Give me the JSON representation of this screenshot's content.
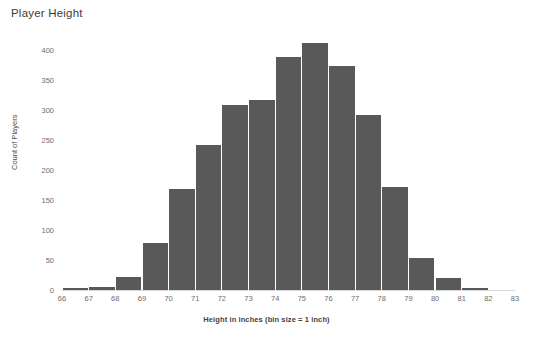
{
  "chart_data": {
    "type": "bar",
    "title": "Player Height",
    "xlabel": "Height in inches (bin size = 1 inch)",
    "ylabel": "Count of Players",
    "grid": false,
    "legend": "none",
    "bar_color": "#595959",
    "axis_color": "#d9d9d9",
    "tick_text_color": "#6e6e6e",
    "xlim": [
      66,
      83
    ],
    "ylim": [
      0,
      400
    ],
    "x_ticks": [
      "66",
      "67",
      "68",
      "69",
      "70",
      "71",
      "72",
      "73",
      "74",
      "75",
      "76",
      "77",
      "78",
      "79",
      "80",
      "81",
      "82",
      "83"
    ],
    "y_ticks": [
      "0",
      "50",
      "100",
      "150",
      "200",
      "250",
      "300",
      "350",
      "400"
    ],
    "bin_size": 1,
    "bins": [
      {
        "left": 66,
        "right": 67,
        "label": "66",
        "value": 3
      },
      {
        "left": 67,
        "right": 68,
        "label": "67",
        "value": 5
      },
      {
        "left": 68,
        "right": 69,
        "label": "68",
        "value": 22
      },
      {
        "left": 69,
        "right": 70,
        "label": "69",
        "value": 78
      },
      {
        "left": 70,
        "right": 71,
        "label": "70",
        "value": 168
      },
      {
        "left": 71,
        "right": 72,
        "label": "71",
        "value": 241
      },
      {
        "left": 72,
        "right": 73,
        "label": "72",
        "value": 309
      },
      {
        "left": 73,
        "right": 74,
        "label": "73",
        "value": 317
      },
      {
        "left": 74,
        "right": 75,
        "label": "74",
        "value": 388
      },
      {
        "left": 75,
        "right": 76,
        "label": "75",
        "value": 412
      },
      {
        "left": 76,
        "right": 77,
        "label": "76",
        "value": 374
      },
      {
        "left": 77,
        "right": 78,
        "label": "77",
        "value": 291
      },
      {
        "left": 78,
        "right": 79,
        "label": "78",
        "value": 171
      },
      {
        "left": 79,
        "right": 80,
        "label": "79",
        "value": 53
      },
      {
        "left": 80,
        "right": 81,
        "label": "80",
        "value": 20
      },
      {
        "left": 81,
        "right": 82,
        "label": "81",
        "value": 4
      }
    ],
    "categories": [
      "66",
      "67",
      "68",
      "69",
      "70",
      "71",
      "72",
      "73",
      "74",
      "75",
      "76",
      "77",
      "78",
      "79",
      "80",
      "81"
    ],
    "values": [
      3,
      5,
      22,
      78,
      168,
      241,
      309,
      317,
      388,
      412,
      374,
      291,
      171,
      53,
      20,
      4
    ]
  }
}
